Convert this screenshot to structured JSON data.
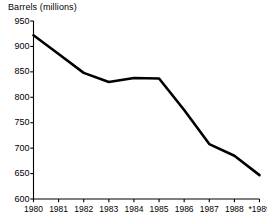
{
  "chart_data": {
    "type": "line",
    "title": "Barrels (millions)",
    "xlabel": "",
    "ylabel": "Barrels (millions)",
    "x": [
      "1980",
      "1981",
      "1982",
      "1983",
      "1984",
      "1985",
      "1986",
      "1987",
      "1988",
      "*1989"
    ],
    "categories": [
      "1980",
      "1981",
      "1982",
      "1983",
      "1984",
      "1985",
      "1986",
      "1987",
      "1988",
      "*1989"
    ],
    "values": [
      922,
      885,
      848,
      830,
      838,
      837,
      775,
      708,
      685,
      647
    ],
    "series": [
      {
        "name": "Barrels (millions)",
        "values": [
          922,
          885,
          848,
          830,
          838,
          837,
          775,
          708,
          685,
          647
        ]
      }
    ],
    "ylim": [
      600,
      950
    ],
    "yticks": [
      600,
      650,
      700,
      750,
      800,
      850,
      900,
      950
    ],
    "ytick_labels": [
      "600",
      "650",
      "700",
      "750",
      "800",
      "850",
      "900",
      "950"
    ],
    "xtick_labels": [
      "1980",
      "1981",
      "1982",
      "1983",
      "1984",
      "1985",
      "1986",
      "1987",
      "1988",
      "*1989"
    ],
    "grid": false,
    "legend": null,
    "legend_position": "none",
    "annotations": [
      "* denotes estimated or projected value for 1989"
    ],
    "line_color": "#000000",
    "axis_color": "#000000",
    "background_color": "#ffffff"
  },
  "labels": {
    "y_axis_title": "Barrels (millions)"
  }
}
